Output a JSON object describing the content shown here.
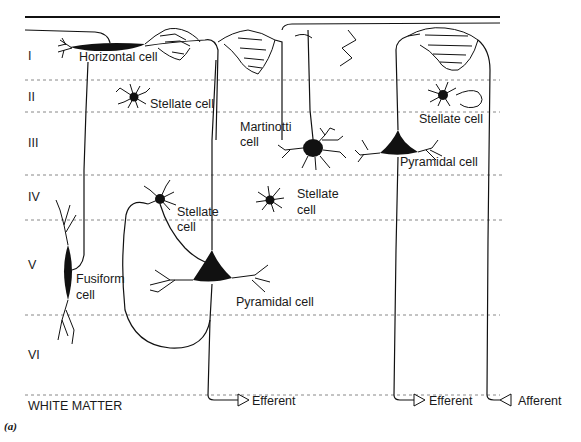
{
  "figure": {
    "panel_label": "(a)",
    "layers": [
      {
        "id": "I",
        "label": "I"
      },
      {
        "id": "II",
        "label": "II"
      },
      {
        "id": "III",
        "label": "III"
      },
      {
        "id": "IV",
        "label": "IV"
      },
      {
        "id": "V",
        "label": "V"
      },
      {
        "id": "VI",
        "label": "VI"
      },
      {
        "id": "WM",
        "label": "WHITE MATTER"
      }
    ],
    "cells": {
      "horizontal": "Horizontal cell",
      "stellate_II": "Stellate cell",
      "stellate_II_right": "Stellate cell",
      "martinotti_1": "Martinotti",
      "martinotti_2": "cell",
      "pyramidal_III": "Pyramidal cell",
      "stellate_IV_1": "Stellate",
      "stellate_IV_2": "cell",
      "stellate_IVb_1": "Stellate",
      "stellate_IVb_2": "cell",
      "fusiform_1": "Fusiform",
      "fusiform_2": "cell",
      "pyramidal_V": "Pyramidal cell"
    },
    "fibers": {
      "efferent_1": "Efferent",
      "efferent_2": "Efferent",
      "afferent": "Afferent"
    }
  }
}
